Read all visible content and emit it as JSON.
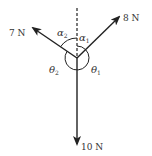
{
  "diagram": {
    "type": "force-diagram",
    "colors": {
      "stroke": "#222222",
      "text": "#333333",
      "background": "#ffffff"
    },
    "forces": [
      {
        "id": "f8",
        "label": "8 N",
        "direction": "upper-right"
      },
      {
        "id": "f7",
        "label": "7 N",
        "direction": "upper-left"
      },
      {
        "id": "f10",
        "label": "10 N",
        "direction": "down"
      }
    ],
    "angles": {
      "alpha1": {
        "symbol": "α",
        "sub": "1"
      },
      "alpha2": {
        "symbol": "α",
        "sub": "2"
      },
      "theta1": {
        "symbol": "θ",
        "sub": "1"
      },
      "theta2": {
        "symbol": "θ",
        "sub": "2"
      }
    },
    "reference_line": "vertical dashed line"
  }
}
